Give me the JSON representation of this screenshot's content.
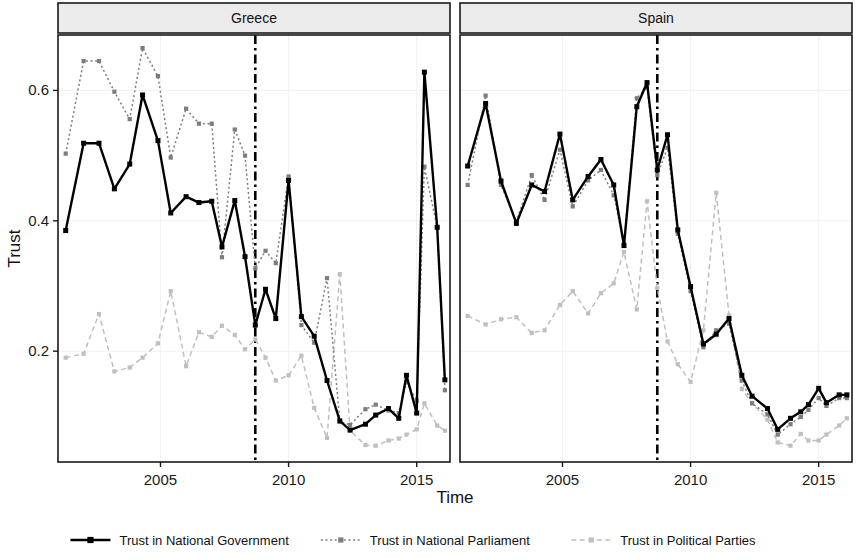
{
  "chart_data": {
    "type": "line",
    "title": "",
    "xlabel": "Time",
    "ylabel": "Trust",
    "xlim": [
      2001.0,
      2016.3
    ],
    "ylim": [
      0.03,
      0.685
    ],
    "xticks": [
      2005,
      2010,
      2015
    ],
    "xtick_labels": [
      "2005",
      "2010",
      "2015"
    ],
    "yticks": [
      0.2,
      0.4,
      0.6
    ],
    "ytick_labels": [
      "0.2",
      "0.4",
      "0.6"
    ],
    "grid": true,
    "legend_position": "bottom",
    "annotations": [
      {
        "type": "vline",
        "x": 2008.7,
        "style": "dashdot",
        "color": "#000000",
        "label": "crisis onset"
      }
    ],
    "panels": [
      {
        "name": "Greece",
        "series": [
          {
            "name": "Trust in National Government",
            "color": "#000000",
            "style": "solid",
            "marker": "square",
            "points": [
              [
                2001.3,
                0.385
              ],
              [
                2002.0,
                0.519
              ],
              [
                2002.6,
                0.519
              ],
              [
                2003.2,
                0.449
              ],
              [
                2003.8,
                0.487
              ],
              [
                2004.3,
                0.593
              ],
              [
                2004.9,
                0.523
              ],
              [
                2005.4,
                0.412
              ],
              [
                2006.0,
                0.437
              ],
              [
                2006.5,
                0.428
              ],
              [
                2007.0,
                0.43
              ],
              [
                2007.4,
                0.36
              ],
              [
                2007.9,
                0.431
              ],
              [
                2008.3,
                0.345
              ],
              [
                2008.7,
                0.24
              ],
              [
                2009.1,
                0.295
              ],
              [
                2009.5,
                0.25
              ],
              [
                2010.0,
                0.462
              ],
              [
                2010.5,
                0.253
              ],
              [
                2011.0,
                0.223
              ],
              [
                2011.5,
                0.155
              ],
              [
                2012.0,
                0.093
              ],
              [
                2012.4,
                0.079
              ],
              [
                2013.0,
                0.088
              ],
              [
                2013.4,
                0.102
              ],
              [
                2013.9,
                0.112
              ],
              [
                2014.3,
                0.097
              ],
              [
                2014.6,
                0.163
              ],
              [
                2015.0,
                0.105
              ],
              [
                2015.3,
                0.628
              ],
              [
                2015.8,
                0.39
              ],
              [
                2016.1,
                0.156
              ]
            ]
          },
          {
            "name": "Trust in National Parliament",
            "color": "#7d7d7d",
            "style": "dotted",
            "marker": "square",
            "points": [
              [
                2001.3,
                0.503
              ],
              [
                2002.0,
                0.645
              ],
              [
                2002.6,
                0.645
              ],
              [
                2003.2,
                0.598
              ],
              [
                2003.8,
                0.556
              ],
              [
                2004.3,
                0.665
              ],
              [
                2004.9,
                0.622
              ],
              [
                2005.4,
                0.497
              ],
              [
                2006.0,
                0.572
              ],
              [
                2006.5,
                0.549
              ],
              [
                2007.0,
                0.549
              ],
              [
                2007.4,
                0.344
              ],
              [
                2007.9,
                0.54
              ],
              [
                2008.3,
                0.5
              ],
              [
                2008.7,
                0.327
              ],
              [
                2009.1,
                0.354
              ],
              [
                2009.5,
                0.335
              ],
              [
                2010.0,
                0.468
              ],
              [
                2010.5,
                0.24
              ],
              [
                2011.0,
                0.213
              ],
              [
                2011.5,
                0.312
              ],
              [
                2012.0,
                0.092
              ],
              [
                2012.4,
                0.087
              ],
              [
                2013.0,
                0.111
              ],
              [
                2013.4,
                0.118
              ],
              [
                2013.9,
                0.109
              ],
              [
                2014.3,
                0.105
              ],
              [
                2014.6,
                0.152
              ],
              [
                2015.0,
                0.124
              ],
              [
                2015.3,
                0.483
              ],
              [
                2015.8,
                0.39
              ],
              [
                2016.1,
                0.14
              ]
            ]
          },
          {
            "name": "Trust in Political Parties",
            "color": "#bfbfbf",
            "style": "dashed",
            "marker": "square",
            "points": [
              [
                2001.3,
                0.19
              ],
              [
                2002.0,
                0.196
              ],
              [
                2002.6,
                0.257
              ],
              [
                2003.2,
                0.169
              ],
              [
                2003.8,
                0.175
              ],
              [
                2004.3,
                0.19
              ],
              [
                2004.9,
                0.212
              ],
              [
                2005.4,
                0.292
              ],
              [
                2006.0,
                0.177
              ],
              [
                2006.5,
                0.229
              ],
              [
                2007.0,
                0.222
              ],
              [
                2007.4,
                0.239
              ],
              [
                2007.9,
                0.225
              ],
              [
                2008.3,
                0.203
              ],
              [
                2008.7,
                0.218
              ],
              [
                2009.1,
                0.19
              ],
              [
                2009.5,
                0.155
              ],
              [
                2010.0,
                0.163
              ],
              [
                2010.5,
                0.193
              ],
              [
                2011.0,
                0.113
              ],
              [
                2011.5,
                0.067
              ],
              [
                2012.0,
                0.318
              ],
              [
                2012.4,
                0.078
              ],
              [
                2013.0,
                0.056
              ],
              [
                2013.4,
                0.055
              ],
              [
                2013.9,
                0.063
              ],
              [
                2014.3,
                0.066
              ],
              [
                2014.6,
                0.072
              ],
              [
                2015.0,
                0.08
              ],
              [
                2015.3,
                0.12
              ],
              [
                2015.8,
                0.086
              ],
              [
                2016.1,
                0.078
              ]
            ]
          }
        ]
      },
      {
        "name": "Spain",
        "series": [
          {
            "name": "Trust in National Government",
            "color": "#000000",
            "style": "solid",
            "marker": "square",
            "points": [
              [
                2001.3,
                0.484
              ],
              [
                2002.0,
                0.58
              ],
              [
                2002.6,
                0.461
              ],
              [
                2003.2,
                0.396
              ],
              [
                2003.8,
                0.455
              ],
              [
                2004.3,
                0.445
              ],
              [
                2004.9,
                0.533
              ],
              [
                2005.4,
                0.432
              ],
              [
                2006.0,
                0.468
              ],
              [
                2006.5,
                0.494
              ],
              [
                2007.0,
                0.455
              ],
              [
                2007.4,
                0.362
              ],
              [
                2007.9,
                0.575
              ],
              [
                2008.3,
                0.612
              ],
              [
                2008.7,
                0.478
              ],
              [
                2009.1,
                0.532
              ],
              [
                2009.5,
                0.386
              ],
              [
                2010.0,
                0.299
              ],
              [
                2010.5,
                0.211
              ],
              [
                2011.0,
                0.226
              ],
              [
                2011.5,
                0.25
              ],
              [
                2012.0,
                0.163
              ],
              [
                2012.4,
                0.131
              ],
              [
                2013.0,
                0.112
              ],
              [
                2013.4,
                0.08
              ],
              [
                2013.9,
                0.097
              ],
              [
                2014.3,
                0.107
              ],
              [
                2014.6,
                0.118
              ],
              [
                2015.0,
                0.143
              ],
              [
                2015.3,
                0.121
              ],
              [
                2015.8,
                0.133
              ],
              [
                2016.1,
                0.133
              ]
            ]
          },
          {
            "name": "Trust in National Parliament",
            "color": "#7d7d7d",
            "style": "dotted",
            "marker": "square",
            "points": [
              [
                2001.3,
                0.455
              ],
              [
                2002.0,
                0.592
              ],
              [
                2002.6,
                0.455
              ],
              [
                2003.2,
                0.399
              ],
              [
                2003.8,
                0.47
              ],
              [
                2004.3,
                0.432
              ],
              [
                2004.9,
                0.509
              ],
              [
                2005.4,
                0.422
              ],
              [
                2006.0,
                0.462
              ],
              [
                2006.5,
                0.478
              ],
              [
                2007.0,
                0.439
              ],
              [
                2007.4,
                0.365
              ],
              [
                2007.9,
                0.588
              ],
              [
                2008.3,
                0.605
              ],
              [
                2008.7,
                0.47
              ],
              [
                2009.1,
                0.512
              ],
              [
                2009.5,
                0.38
              ],
              [
                2010.0,
                0.292
              ],
              [
                2010.5,
                0.206
              ],
              [
                2011.0,
                0.232
              ],
              [
                2011.5,
                0.242
              ],
              [
                2012.0,
                0.155
              ],
              [
                2012.4,
                0.12
              ],
              [
                2013.0,
                0.103
              ],
              [
                2013.4,
                0.072
              ],
              [
                2013.9,
                0.088
              ],
              [
                2014.3,
                0.099
              ],
              [
                2014.6,
                0.11
              ],
              [
                2015.0,
                0.128
              ],
              [
                2015.3,
                0.116
              ],
              [
                2015.8,
                0.128
              ],
              [
                2016.1,
                0.128
              ]
            ]
          },
          {
            "name": "Trust in Political Parties",
            "color": "#bfbfbf",
            "style": "dashed",
            "marker": "square",
            "points": [
              [
                2001.3,
                0.254
              ],
              [
                2002.0,
                0.241
              ],
              [
                2002.6,
                0.249
              ],
              [
                2003.2,
                0.252
              ],
              [
                2003.8,
                0.228
              ],
              [
                2004.3,
                0.232
              ],
              [
                2004.9,
                0.271
              ],
              [
                2005.4,
                0.292
              ],
              [
                2006.0,
                0.258
              ],
              [
                2006.5,
                0.289
              ],
              [
                2007.0,
                0.304
              ],
              [
                2007.4,
                0.352
              ],
              [
                2007.9,
                0.264
              ],
              [
                2008.3,
                0.43
              ],
              [
                2008.7,
                0.297
              ],
              [
                2009.1,
                0.215
              ],
              [
                2009.5,
                0.18
              ],
              [
                2010.0,
                0.153
              ],
              [
                2010.5,
                0.232
              ],
              [
                2011.0,
                0.443
              ],
              [
                2011.5,
                0.255
              ],
              [
                2012.0,
                0.142
              ],
              [
                2012.4,
                0.12
              ],
              [
                2013.0,
                0.095
              ],
              [
                2013.4,
                0.06
              ],
              [
                2013.9,
                0.055
              ],
              [
                2014.3,
                0.073
              ],
              [
                2014.6,
                0.063
              ],
              [
                2015.0,
                0.063
              ],
              [
                2015.3,
                0.072
              ],
              [
                2015.8,
                0.086
              ],
              [
                2016.1,
                0.097
              ]
            ]
          }
        ]
      }
    ],
    "legend": [
      {
        "label": "Trust in National Government",
        "color": "#000000",
        "style": "solid"
      },
      {
        "label": "Trust in National Parliament",
        "color": "#7d7d7d",
        "style": "dotted"
      },
      {
        "label": "Trust in Political Parties",
        "color": "#bfbfbf",
        "style": "dashed"
      }
    ]
  },
  "colors": {
    "background": "#ffffff",
    "panel_border": "#1a1a1a",
    "strip_fill": "#ebebeb",
    "grid": "#f2f2f2",
    "government": "#000000",
    "parliament": "#7d7d7d",
    "parties": "#bfbfbf"
  }
}
